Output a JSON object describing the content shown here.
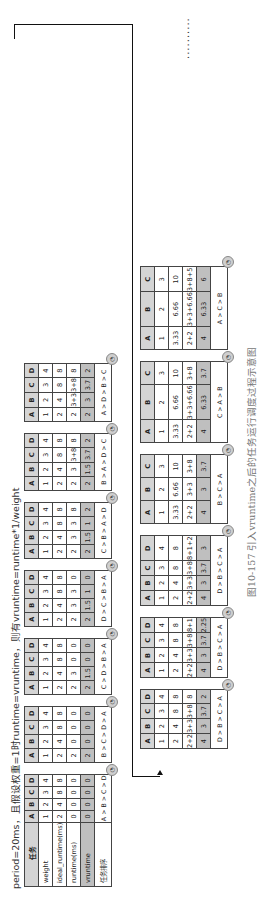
{
  "header": "period=20ms，且假设权重=1时runtime=vruntime，则有vruntime=runtime*1/weight",
  "caption": "图10-157   引入vruntime之后的任务运行调度过程示意图",
  "continuation": "..........",
  "init_table": {
    "labels": [
      "任务",
      "weight",
      "ideal_runtime(ms)",
      "runtime(ms)",
      "vruntime",
      "任务排序"
    ],
    "columns": [
      "A",
      "B",
      "C",
      "D"
    ],
    "weight": [
      "1",
      "2",
      "3",
      "4"
    ],
    "ideal": [
      "2",
      "4",
      "8",
      "8"
    ],
    "runtime": [
      "0",
      "0",
      "0",
      "0"
    ],
    "vruntime": [
      "0",
      "0",
      "0",
      "0"
    ],
    "order": "A > B > C > D"
  },
  "row1": [
    {
      "cols": [
        "A",
        "B",
        "C",
        "D"
      ],
      "weight": [
        "1",
        "2",
        "3",
        "4"
      ],
      "ideal": [
        "2",
        "4",
        "8",
        "8"
      ],
      "runtime": [
        "2",
        "0",
        "0",
        "0"
      ],
      "vruntime": [
        "2",
        "0",
        "0",
        "0"
      ],
      "order": "B > C > D > A"
    },
    {
      "cols": [
        "A",
        "B",
        "C",
        "D"
      ],
      "weight": [
        "1",
        "2",
        "3",
        "4"
      ],
      "ideal": [
        "2",
        "4",
        "8",
        "8"
      ],
      "runtime": [
        "2",
        "3",
        "0",
        "0"
      ],
      "vruntime": [
        "2",
        "1.5",
        "0",
        "0"
      ],
      "order": "C > D > B > A"
    },
    {
      "cols": [
        "A",
        "B",
        "C",
        "D"
      ],
      "weight": [
        "1",
        "2",
        "3",
        "4"
      ],
      "ideal": [
        "2",
        "4",
        "8",
        "8"
      ],
      "runtime": [
        "2",
        "3",
        "3",
        "0"
      ],
      "vruntime": [
        "2",
        "1.5",
        "1",
        "0"
      ],
      "order": "D > C > B > A"
    },
    {
      "cols": [
        "A",
        "B",
        "C",
        "D"
      ],
      "weight": [
        "1",
        "2",
        "3",
        "4"
      ],
      "ideal": [
        "2",
        "4",
        "8",
        "8"
      ],
      "runtime": [
        "2",
        "3",
        "3",
        "8"
      ],
      "vruntime": [
        "2",
        "1.5",
        "1",
        "2"
      ],
      "order": "C > B > A > D"
    },
    {
      "cols": [
        "A",
        "B",
        "C",
        "D"
      ],
      "weight": [
        "1",
        "2",
        "3",
        "4"
      ],
      "ideal": [
        "2",
        "4",
        "8",
        "8"
      ],
      "runtime": [
        "2",
        "3",
        "3+8",
        "8"
      ],
      "vruntime": [
        "2",
        "1.5",
        "3.7",
        "2"
      ],
      "order": "B > A > D > C"
    },
    {
      "cols": [
        "A",
        "B",
        "C",
        "D"
      ],
      "weight": [
        "1",
        "2",
        "3",
        "4"
      ],
      "ideal": [
        "2",
        "4",
        "8",
        "8"
      ],
      "runtime": [
        "2",
        "3+3",
        "3+8",
        "8"
      ],
      "vruntime": [
        "2",
        "3",
        "3.7",
        "2"
      ],
      "order": "A > D > B > C"
    }
  ],
  "row2": [
    {
      "cols": [
        "A",
        "B",
        "C",
        "D"
      ],
      "weight": [
        "1",
        "2",
        "3",
        "4"
      ],
      "ideal": [
        "2",
        "4",
        "8",
        "8"
      ],
      "runtime": [
        "2+2",
        "3+3",
        "3+8",
        "8"
      ],
      "vruntime": [
        "4",
        "3",
        "3.7",
        "2"
      ],
      "order": "D > B > C > A"
    },
    {
      "cols": [
        "A",
        "B",
        "C",
        "D"
      ],
      "weight": [
        "1",
        "2",
        "3",
        "4"
      ],
      "ideal": [
        "2",
        "4",
        "8",
        "8"
      ],
      "runtime": [
        "2+2",
        "3+3",
        "3+8",
        "8+1"
      ],
      "vruntime": [
        "4",
        "3",
        "3.7",
        "2.25"
      ],
      "order": "D > B > C > A"
    },
    {
      "cols": [
        "A",
        "B",
        "C",
        "D"
      ],
      "weight": [
        "1",
        "2",
        "3",
        "4"
      ],
      "ideal": [
        "2",
        "4",
        "8",
        "8"
      ],
      "runtime": [
        "2+2",
        "3+3",
        "3+8",
        "8+1+2"
      ],
      "vruntime": [
        "4",
        "3",
        "3.7",
        "3"
      ],
      "order": "D > B > C > A"
    },
    {
      "cols": [
        "A",
        "B",
        "C"
      ],
      "weight": [
        "1",
        "2",
        "3"
      ],
      "ideal": [
        "3.33",
        "6.66",
        "10"
      ],
      "runtime": [
        "2+2",
        "3+3",
        "3+8"
      ],
      "vruntime": [
        "4",
        "3",
        "3.7"
      ],
      "order": "B > C > A"
    },
    {
      "cols": [
        "A",
        "B",
        "C"
      ],
      "weight": [
        "1",
        "2",
        "3"
      ],
      "ideal": [
        "3.33",
        "6.66",
        "10"
      ],
      "runtime": [
        "2+2",
        "3+3+6.66",
        "3+8"
      ],
      "vruntime": [
        "4",
        "6.33",
        "3.7"
      ],
      "order": "C > A > B"
    },
    {
      "cols": [
        "A",
        "B",
        "C"
      ],
      "weight": [
        "1",
        "2",
        "3"
      ],
      "ideal": [
        "3.33",
        "6.66",
        "10"
      ],
      "runtime": [
        "2+2",
        "3+3+6.66",
        "3+8+5"
      ],
      "vruntime": [
        "4",
        "6.33",
        "6"
      ],
      "order": "A > C > B"
    }
  ],
  "colors": {
    "header_bg": "#d4d4d4",
    "vruntime_bg": "#bfbfbf",
    "border": "#444444",
    "caption": "#777777"
  }
}
